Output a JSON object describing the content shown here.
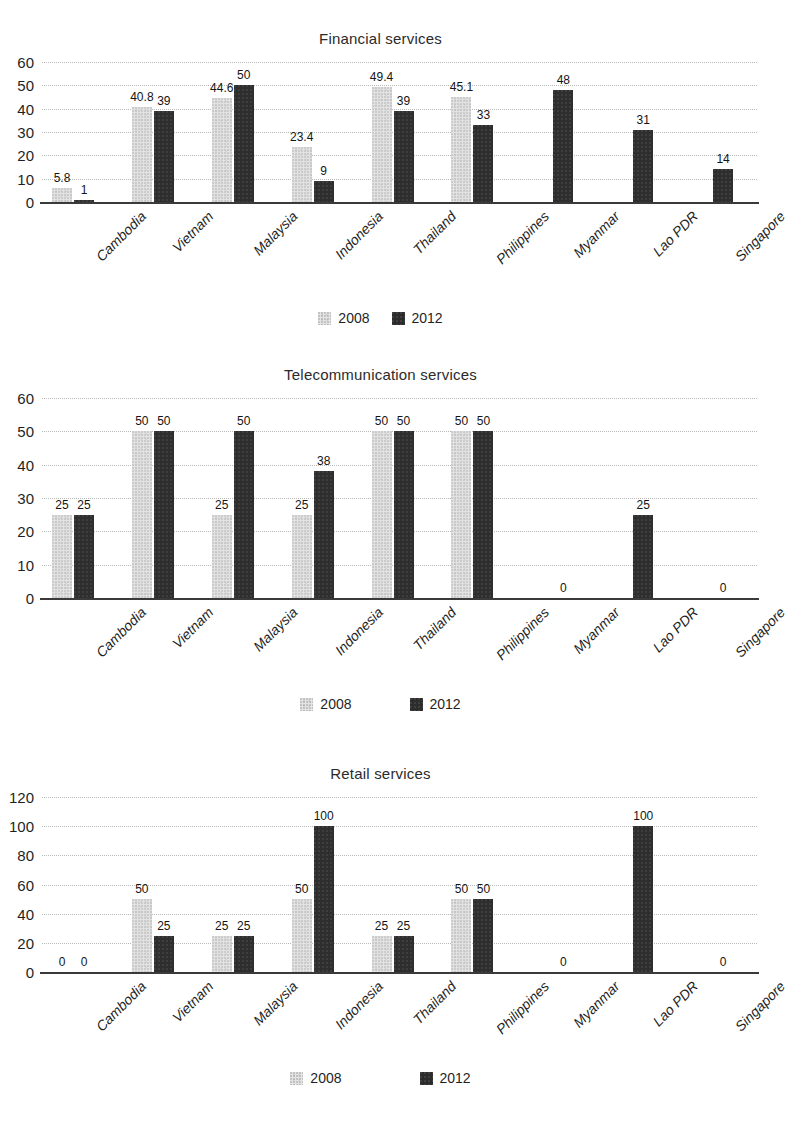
{
  "figure": {
    "legend_labels": [
      "2008",
      "2012"
    ],
    "series_colors": {
      "2008": "#e2e2e2",
      "2012": "#2e2e2e"
    }
  },
  "charts": [
    {
      "title": "Financial services",
      "ylim": [
        0,
        60
      ],
      "yticks": [
        "0",
        "10",
        "20",
        "30",
        "40",
        "50",
        "60"
      ],
      "categories": [
        "Cambodia",
        "Vietnam",
        "Malaysia",
        "Indonesia",
        "Thailand",
        "Philippines",
        "Myanmar",
        "Lao PDR",
        "Singapore"
      ],
      "labels_2008": [
        "5.8",
        "40.8",
        "44.6",
        "23.4",
        "49.4",
        "45.1",
        "",
        "",
        ""
      ],
      "labels_2012": [
        "1",
        "39",
        "50",
        "9",
        "39",
        "33",
        "48",
        "31",
        "14"
      ],
      "values_2008": [
        5.8,
        40.8,
        44.6,
        23.4,
        49.4,
        45.1,
        null,
        null,
        null
      ],
      "values_2012": [
        1,
        39,
        50,
        9,
        39,
        33,
        48,
        31,
        14
      ]
    },
    {
      "title": "Telecommunication services",
      "ylim": [
        0,
        60
      ],
      "yticks": [
        "0",
        "10",
        "20",
        "30",
        "40",
        "50",
        "60"
      ],
      "categories": [
        "Cambodia",
        "Vietnam",
        "Malaysia",
        "Indonesia",
        "Thailand",
        "Philippines",
        "Myanmar",
        "Lao PDR",
        "Singapore"
      ],
      "labels_2008": [
        "25",
        "50",
        "25",
        "25",
        "50",
        "50",
        "",
        "",
        ""
      ],
      "labels_2012": [
        "25",
        "50",
        "50",
        "38",
        "50",
        "50",
        "0",
        "25",
        "0"
      ],
      "values_2008": [
        25,
        50,
        25,
        25,
        50,
        50,
        null,
        null,
        null
      ],
      "values_2012": [
        25,
        50,
        50,
        38,
        50,
        50,
        0,
        25,
        0
      ]
    },
    {
      "title": "Retail services",
      "ylim": [
        0,
        120
      ],
      "yticks": [
        "0",
        "20",
        "40",
        "60",
        "80",
        "100",
        "120"
      ],
      "categories": [
        "Cambodia",
        "Vietnam",
        "Malaysia",
        "Indonesia",
        "Thailand",
        "Philippines",
        "Myanmar",
        "Lao PDR",
        "Singapore"
      ],
      "labels_2008": [
        "0",
        "50",
        "25",
        "50",
        "25",
        "50",
        "",
        "",
        ""
      ],
      "labels_2012": [
        "0",
        "25",
        "25",
        "100",
        "25",
        "50",
        "0",
        "100",
        "0"
      ],
      "values_2008": [
        0,
        50,
        25,
        50,
        25,
        50,
        null,
        null,
        null
      ],
      "values_2012": [
        0,
        25,
        25,
        100,
        25,
        50,
        0,
        100,
        0
      ]
    }
  ],
  "chart_data": [
    {
      "type": "bar",
      "title": "Financial services",
      "xlabel": "",
      "ylabel": "",
      "ylim": [
        0,
        60
      ],
      "yticks": [
        0,
        10,
        20,
        30,
        40,
        50,
        60
      ],
      "grid": true,
      "legend_position": "bottom-center",
      "categories": [
        "Cambodia",
        "Vietnam",
        "Malaysia",
        "Indonesia",
        "Thailand",
        "Philippines",
        "Myanmar",
        "Lao PDR",
        "Singapore"
      ],
      "series": [
        {
          "name": "2008",
          "values": [
            5.8,
            40.8,
            44.6,
            23.4,
            49.4,
            45.1,
            null,
            null,
            null
          ]
        },
        {
          "name": "2012",
          "values": [
            1,
            39,
            50,
            9,
            39,
            33,
            48,
            31,
            14
          ]
        }
      ]
    },
    {
      "type": "bar",
      "title": "Telecommunication services",
      "xlabel": "",
      "ylabel": "",
      "ylim": [
        0,
        60
      ],
      "yticks": [
        0,
        10,
        20,
        30,
        40,
        50,
        60
      ],
      "grid": true,
      "legend_position": "bottom-center",
      "categories": [
        "Cambodia",
        "Vietnam",
        "Malaysia",
        "Indonesia",
        "Thailand",
        "Philippines",
        "Myanmar",
        "Lao PDR",
        "Singapore"
      ],
      "series": [
        {
          "name": "2008",
          "values": [
            25,
            50,
            25,
            25,
            50,
            50,
            null,
            null,
            null
          ]
        },
        {
          "name": "2012",
          "values": [
            25,
            50,
            50,
            38,
            50,
            50,
            0,
            25,
            0
          ]
        }
      ]
    },
    {
      "type": "bar",
      "title": "Retail services",
      "xlabel": "",
      "ylabel": "",
      "ylim": [
        0,
        120
      ],
      "yticks": [
        0,
        20,
        40,
        60,
        80,
        100,
        120
      ],
      "grid": true,
      "legend_position": "bottom-center",
      "categories": [
        "Cambodia",
        "Vietnam",
        "Malaysia",
        "Indonesia",
        "Thailand",
        "Philippines",
        "Myanmar",
        "Lao PDR",
        "Singapore"
      ],
      "series": [
        {
          "name": "2008",
          "values": [
            0,
            50,
            25,
            50,
            25,
            50,
            null,
            null,
            null
          ]
        },
        {
          "name": "2012",
          "values": [
            0,
            25,
            25,
            100,
            25,
            50,
            0,
            100,
            0
          ]
        }
      ]
    }
  ]
}
